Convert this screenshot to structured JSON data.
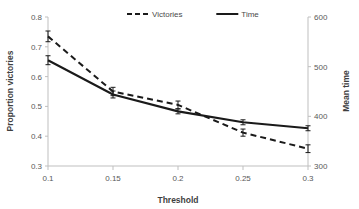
{
  "chart_data": {
    "type": "line",
    "title": "",
    "xlabel": "Threshold",
    "ylabel": "Proportion victories",
    "y2label": "Mean time",
    "x": [
      0.1,
      0.15,
      0.2,
      0.25,
      0.3
    ],
    "xtick_labels": [
      "0.1",
      "0.15",
      "0.2",
      "0.25",
      "0.3"
    ],
    "ylim": [
      0.3,
      0.8
    ],
    "ytick_labels": [
      "0.3",
      "0.4",
      "0.5",
      "0.6",
      "0.7",
      "0.8"
    ],
    "ytick_values": [
      0.3,
      0.4,
      0.5,
      0.6,
      0.7,
      0.8
    ],
    "y2lim": [
      300,
      600
    ],
    "y2tick_labels": [
      "300",
      "400",
      "500",
      "600"
    ],
    "y2tick_values": [
      300,
      400,
      500,
      600
    ],
    "grid": false,
    "legend_position": "top-center",
    "series": [
      {
        "name": "Victories",
        "axis": "left",
        "style": "dashed",
        "color": "#1a1a1a",
        "values": [
          0.735,
          0.55,
          0.505,
          0.412,
          0.358
        ],
        "errors": [
          0.018,
          0.014,
          0.013,
          0.012,
          0.013
        ]
      },
      {
        "name": "Time",
        "axis": "right",
        "style": "solid",
        "color": "#1a1a1a",
        "values": [
          513,
          444,
          410,
          388,
          376
        ],
        "errors": [
          9,
          7,
          5,
          5,
          5
        ]
      }
    ]
  },
  "legend": {
    "items": [
      {
        "label": "Victories",
        "style": "dashed"
      },
      {
        "label": "Time",
        "style": "solid"
      }
    ]
  },
  "axes": {
    "x_title": "Threshold",
    "y_left_title": "Proportion victories",
    "y_right_title": "Mean time"
  }
}
